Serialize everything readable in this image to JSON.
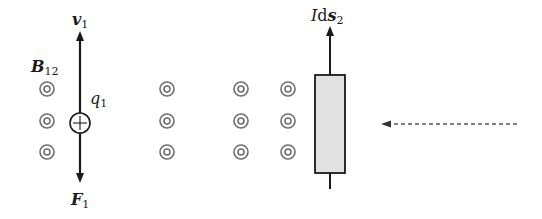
{
  "labels": {
    "v1": {
      "symbol": "v",
      "sub": "1"
    },
    "B12": {
      "symbol": "B",
      "sub": "12"
    },
    "q1": {
      "symbol": "q",
      "sub": "1"
    },
    "F1": {
      "symbol": "F",
      "sub": "1"
    },
    "Ids2": {
      "prefix": "I",
      "d": "d",
      "symbol": "s",
      "sub": "2"
    }
  },
  "field_markers": {
    "symbol": "out-of-page (dot in circle)",
    "columns_x": [
      47,
      167,
      241,
      288
    ],
    "rows_y": [
      89,
      121,
      152
    ]
  },
  "charge": {
    "sign": "+",
    "x": 80,
    "y": 123
  },
  "colors": {
    "stroke": "#1a1a1a",
    "marker": "#6e6e6e",
    "conductor_fill": "#e2e2e2",
    "dashed": "#555555"
  }
}
